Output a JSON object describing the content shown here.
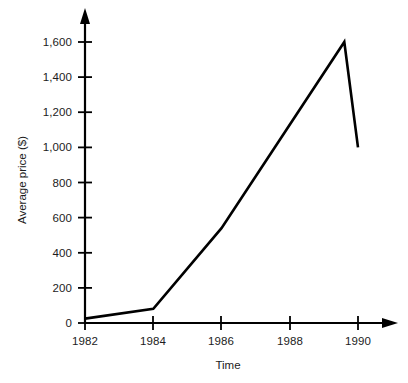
{
  "chart_data": {
    "type": "line",
    "title": "",
    "xlabel": "Time",
    "ylabel": "Average price ($)",
    "xlim": [
      1982,
      1990.6
    ],
    "ylim": [
      0,
      1700
    ],
    "grid": false,
    "legend": "none",
    "x_ticks": [
      1982,
      1984,
      1986,
      1988,
      1990
    ],
    "x_tick_labels": [
      "1982",
      "1984",
      "1986",
      "1988",
      "1990"
    ],
    "y_ticks": [
      0,
      200,
      400,
      600,
      800,
      1000,
      1200,
      1400,
      1600
    ],
    "y_tick_labels": [
      "0",
      "200",
      "400",
      "600",
      "800",
      "1,000",
      "1,200",
      "1,400",
      "1,600"
    ],
    "series": [
      {
        "name": "Average price",
        "color": "#000000",
        "x": [
          1982,
          1984,
          1986,
          1989.6,
          1990
        ],
        "values": [
          25,
          80,
          540,
          1600,
          1000
        ]
      }
    ],
    "axis_style": {
      "arrow_heads": true,
      "line_color": "#000000",
      "text_color": "#1c1c1c",
      "background": "#ffffff"
    }
  }
}
